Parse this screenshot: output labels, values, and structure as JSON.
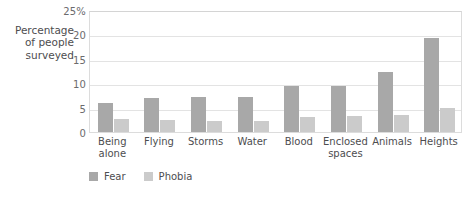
{
  "chart_data": {
    "type": "bar",
    "title": "",
    "subtitle": "",
    "xlabel": "",
    "ylabel": "Percentage\nof people\nsurveyed",
    "ylim": [
      0,
      25
    ],
    "ytick_values": [
      0,
      5,
      10,
      15,
      20,
      25
    ],
    "ytick_labels": [
      "0",
      "5",
      "10",
      "15",
      "20",
      "25%"
    ],
    "grid": true,
    "legend_position": "bottom-left",
    "categories": [
      "Being\nalone",
      "Flying",
      "Storms",
      "Water",
      "Blood",
      "Enclosed\nspaces",
      "Animals",
      "Heights"
    ],
    "series": [
      {
        "name": "Fear",
        "color": "#a8a8a8",
        "values": [
          5.9,
          7.0,
          7.1,
          7.1,
          9.5,
          9.4,
          12.4,
          19.2
        ]
      },
      {
        "name": "Phobia",
        "color": "#cbcbcb",
        "values": [
          2.7,
          2.5,
          2.3,
          2.3,
          3.1,
          3.2,
          3.5,
          5.0
        ]
      }
    ]
  },
  "colors": {
    "fear": "#a8a8a8",
    "phobia": "#cbcbcb",
    "gridline": "#e3e3e3",
    "plot_border": "#dcdcdc",
    "text": "#4d4d4f",
    "background": "#ffffff"
  }
}
